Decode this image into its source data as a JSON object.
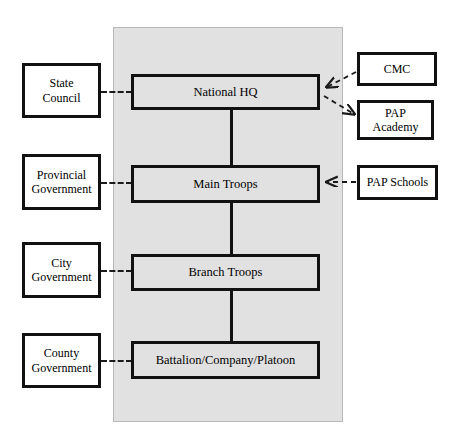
{
  "diagram": {
    "panel_label": "central-command-chain-panel",
    "colors": {
      "panel_background": "#e1e1e1",
      "node_fill": "#e1e1e1",
      "side_fill": "#ffffff",
      "border": "#111111",
      "connector": "#1a1a1a"
    }
  },
  "core_nodes": [
    {
      "id": "national-hq",
      "label": "National HQ"
    },
    {
      "id": "main-troops",
      "label": "Main Troops"
    },
    {
      "id": "branch-troops",
      "label": "Branch Troops"
    },
    {
      "id": "battalion-company-platoon",
      "label": "Battalion/Company/Platoon"
    }
  ],
  "left_nodes": [
    {
      "id": "state-council",
      "line1": "State",
      "line2": "Council"
    },
    {
      "id": "provincial-government",
      "line1": "Provincial",
      "line2": "Government"
    },
    {
      "id": "city-government",
      "line1": "City",
      "line2": "Government"
    },
    {
      "id": "county-government",
      "line1": "County",
      "line2": "Government"
    }
  ],
  "right_nodes": [
    {
      "id": "cmc",
      "line1": "CMC",
      "line2": ""
    },
    {
      "id": "pap-academy",
      "line1": "PAP",
      "line2": "Academy"
    },
    {
      "id": "pap-schools",
      "line1": "PAP Schools",
      "line2": ""
    }
  ],
  "connections": [
    {
      "id": "state-council-to-national-hq",
      "style": "dashed",
      "arrow": "none"
    },
    {
      "id": "provincial-government-to-main-troops",
      "style": "dashed",
      "arrow": "none"
    },
    {
      "id": "city-government-to-branch-troops",
      "style": "dashed",
      "arrow": "none"
    },
    {
      "id": "county-government-to-battalion",
      "style": "dashed",
      "arrow": "none"
    },
    {
      "id": "cmc-to-national-hq",
      "style": "dashed",
      "arrow": "to-national-hq"
    },
    {
      "id": "national-hq-to-pap-academy",
      "style": "dashed",
      "arrow": "to-pap-academy"
    },
    {
      "id": "pap-schools-to-main-troops",
      "style": "dashed",
      "arrow": "to-main-troops"
    },
    {
      "id": "national-hq-to-main-troops",
      "style": "solid",
      "arrow": "none"
    },
    {
      "id": "main-troops-to-branch-troops",
      "style": "solid",
      "arrow": "none"
    },
    {
      "id": "branch-troops-to-battalion",
      "style": "solid",
      "arrow": "none"
    }
  ]
}
